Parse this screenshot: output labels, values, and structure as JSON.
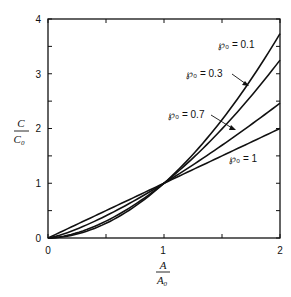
{
  "chart_data": {
    "type": "line",
    "title": "",
    "xlabel": "A / A0",
    "ylabel": "C / C0",
    "xlim": [
      0,
      2
    ],
    "ylim": [
      0,
      4
    ],
    "x_ticks": [
      0,
      1,
      2
    ],
    "x_minor_ticks": [
      0.5,
      1.5
    ],
    "y_ticks": [
      0,
      1,
      2,
      3,
      4
    ],
    "y_minor_ticks": [
      0.5,
      1.5,
      2.5,
      3.5
    ],
    "grid": false,
    "legend_position": "inline labels with arrows",
    "x": [
      0,
      0.25,
      0.5,
      0.75,
      1.0,
      1.25,
      1.5,
      1.75,
      2.0
    ],
    "series": [
      {
        "name": "P0 = 0.1",
        "label": "℘₀ = 0.1",
        "exponent": 1.9,
        "values": [
          0,
          0.07,
          0.27,
          0.58,
          1.0,
          1.53,
          2.16,
          2.9,
          3.73
        ]
      },
      {
        "name": "P0 = 0.3",
        "label": "℘₀ = 0.3",
        "exponent": 1.7,
        "values": [
          0,
          0.09,
          0.31,
          0.61,
          1.0,
          1.46,
          1.99,
          2.59,
          3.25
        ]
      },
      {
        "name": "P0 = 0.7",
        "label": "℘₀ = 0.7",
        "exponent": 1.3,
        "values": [
          0,
          0.16,
          0.41,
          0.69,
          1.0,
          1.34,
          1.69,
          2.07,
          2.46
        ]
      },
      {
        "name": "P0 = 1",
        "label": "℘₀ = 1",
        "exponent": 1.0,
        "values": [
          0,
          0.25,
          0.5,
          0.75,
          1.0,
          1.25,
          1.5,
          1.75,
          2.0
        ]
      }
    ],
    "annotations": [
      "℘₀ = 0.1",
      "℘₀ = 0.3",
      "℘₀ = 0.7",
      "℘₀ = 1"
    ]
  },
  "axes": {
    "x_label_num": "A",
    "x_label_den": "A",
    "x_label_den_sub": "0",
    "y_label_num": "C",
    "y_label_den": "C",
    "y_label_den_sub": "0",
    "x_tick_labels": [
      "0",
      "1",
      "2"
    ],
    "y_tick_labels": [
      "0",
      "1",
      "2",
      "3",
      "4"
    ]
  },
  "labels": {
    "p01": "℘₀ = 0.1",
    "p03": "℘₀ = 0.3",
    "p07": "℘₀ = 0.7",
    "p1": "℘₀ = 1"
  },
  "style": {
    "line_color": "#111111",
    "background": "#ffffff"
  }
}
